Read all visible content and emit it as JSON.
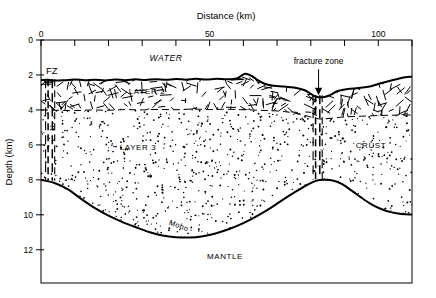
{
  "figure": {
    "type": "cross-section-diagram",
    "background_color": "#ffffff",
    "line_color": "#000000",
    "frame": {
      "left_px": 41,
      "right_px": 412,
      "top_px": 40,
      "bottom_px": 283
    }
  },
  "axes": {
    "x": {
      "title": "Distance (km)",
      "min": 0,
      "max": 110,
      "major_tick_labels": [
        "0",
        "50",
        "100"
      ],
      "major_tick_values": [
        0,
        50,
        100
      ],
      "minor_tick_step": 10,
      "tick_side": "top"
    },
    "y": {
      "title": "Depth (km)",
      "min": 0,
      "max": 13.9,
      "tick_labels": [
        "0",
        "2",
        "4",
        "6",
        "8",
        "10",
        "12"
      ],
      "tick_values": [
        0,
        2,
        4,
        6,
        8,
        10,
        12
      ],
      "direction": "down",
      "tick_side": "left"
    }
  },
  "labels": {
    "water": "WATER",
    "layer2": "LAYER 2",
    "layer3": "LAYER 3",
    "crust": "CRUST",
    "mantle": "MANTLE",
    "moho": "Moho",
    "fz": "FZ",
    "fracture_zone": "fracture zone"
  },
  "chart_data": {
    "type": "line",
    "title": "",
    "xlabel": "Distance (km)",
    "ylabel": "Depth (km)",
    "xlim": [
      0,
      110
    ],
    "ylim": [
      0,
      13.9
    ],
    "y_inverted": true,
    "grid": false,
    "legend": "none",
    "series": [
      {
        "name": "seafloor",
        "style": "solid-thick",
        "points": [
          [
            0.0,
            2.3
          ],
          [
            2.0,
            2.28
          ],
          [
            4.5,
            2.32
          ],
          [
            7.0,
            2.3
          ],
          [
            10.0,
            2.26
          ],
          [
            13.0,
            2.3
          ],
          [
            16.0,
            2.27
          ],
          [
            19.0,
            2.31
          ],
          [
            22.0,
            2.26
          ],
          [
            25.0,
            2.3
          ],
          [
            28.0,
            2.25
          ],
          [
            31.0,
            2.29
          ],
          [
            34.0,
            2.24
          ],
          [
            37.0,
            2.28
          ],
          [
            40.0,
            2.23
          ],
          [
            43.0,
            2.27
          ],
          [
            46.0,
            2.22
          ],
          [
            49.0,
            2.26
          ],
          [
            52.0,
            2.22
          ],
          [
            55.0,
            2.25
          ],
          [
            58.0,
            2.2
          ],
          [
            60.5,
            1.93
          ],
          [
            62.5,
            2.06
          ],
          [
            64.5,
            2.33
          ],
          [
            66.5,
            2.52
          ],
          [
            69.0,
            2.62
          ],
          [
            72.0,
            2.66
          ],
          [
            75.0,
            2.72
          ],
          [
            78.0,
            2.86
          ],
          [
            80.0,
            3.08
          ],
          [
            81.2,
            3.22
          ],
          [
            82.3,
            3.27
          ],
          [
            84.0,
            3.26
          ],
          [
            86.0,
            3.12
          ],
          [
            88.0,
            2.92
          ],
          [
            91.0,
            2.8
          ],
          [
            94.0,
            2.75
          ],
          [
            97.0,
            2.68
          ],
          [
            100.0,
            2.52
          ],
          [
            103.0,
            2.36
          ],
          [
            106.0,
            2.22
          ],
          [
            108.5,
            2.12
          ],
          [
            110.0,
            2.1
          ]
        ]
      },
      {
        "name": "layer2-layer3-boundary",
        "style": "dashed-thin",
        "points": [
          [
            0.0,
            4.0
          ],
          [
            5.0,
            4.02
          ],
          [
            10.0,
            4.04
          ],
          [
            15.0,
            4.0
          ],
          [
            20.0,
            4.02
          ],
          [
            25.0,
            3.98
          ],
          [
            30.0,
            4.0
          ],
          [
            35.0,
            3.97
          ],
          [
            40.0,
            3.99
          ],
          [
            45.0,
            3.95
          ],
          [
            50.0,
            3.98
          ],
          [
            55.0,
            3.96
          ],
          [
            60.0,
            3.99
          ],
          [
            65.0,
            4.02
          ],
          [
            70.0,
            4.06
          ],
          [
            74.0,
            4.14
          ],
          [
            78.0,
            4.3
          ],
          [
            81.0,
            4.46
          ],
          [
            83.0,
            4.52
          ],
          [
            86.0,
            4.48
          ],
          [
            90.0,
            4.4
          ],
          [
            95.0,
            4.36
          ],
          [
            100.0,
            4.32
          ],
          [
            105.0,
            4.3
          ],
          [
            110.0,
            4.28
          ]
        ]
      },
      {
        "name": "moho",
        "style": "solid-thick",
        "points": [
          [
            0.0,
            8.0
          ],
          [
            4.0,
            8.18
          ],
          [
            8.0,
            8.55
          ],
          [
            12.0,
            9.1
          ],
          [
            16.0,
            9.62
          ],
          [
            20.0,
            10.05
          ],
          [
            24.0,
            10.4
          ],
          [
            28.0,
            10.7
          ],
          [
            32.0,
            10.98
          ],
          [
            36.0,
            11.18
          ],
          [
            40.0,
            11.28
          ],
          [
            44.0,
            11.3
          ],
          [
            48.0,
            11.22
          ],
          [
            52.0,
            11.05
          ],
          [
            56.0,
            10.8
          ],
          [
            60.0,
            10.48
          ],
          [
            64.0,
            10.08
          ],
          [
            68.0,
            9.62
          ],
          [
            72.0,
            9.1
          ],
          [
            76.0,
            8.62
          ],
          [
            79.0,
            8.28
          ],
          [
            81.5,
            8.06
          ],
          [
            84.0,
            8.0
          ],
          [
            86.5,
            8.04
          ],
          [
            89.0,
            8.22
          ],
          [
            92.0,
            8.6
          ],
          [
            95.0,
            9.02
          ],
          [
            98.0,
            9.4
          ],
          [
            101.0,
            9.68
          ],
          [
            104.0,
            9.86
          ],
          [
            107.0,
            9.95
          ],
          [
            110.0,
            9.98
          ]
        ]
      }
    ],
    "annotations": [
      {
        "name": "fracture-zone-arrow",
        "text": "fracture zone",
        "x": 82.3,
        "y_tip": 3.22,
        "type": "arrow-down"
      },
      {
        "name": "fz-left-marker",
        "text": "FZ",
        "x": 3.0,
        "y": 1.55,
        "type": "text"
      },
      {
        "name": "fracture-zone-left",
        "x": 3.0,
        "depth_top": 2.3,
        "depth_bottom": 8.05,
        "type": "vertical-dashed-band"
      },
      {
        "name": "fracture-zone-center",
        "x": 82.3,
        "depth_top": 3.22,
        "depth_bottom": 8.0,
        "type": "vertical-dashed-band"
      }
    ]
  }
}
